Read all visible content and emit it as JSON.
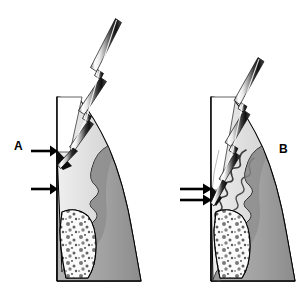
{
  "figure": {
    "type": "medical-illustration",
    "background_color": "#ffffff",
    "width": 308,
    "height": 291,
    "panels": [
      {
        "id": "A",
        "label": "A",
        "label_x": 14,
        "label_y": 140,
        "description": "Healthy gingival sulcus, probe tip stops at shallow depth",
        "arrow_count": 2,
        "arrows": [
          {
            "label": "",
            "y": 151,
            "tip_x": 57,
            "tail_x": 31,
            "meaning": "gingival-margin-level"
          },
          {
            "label": "",
            "y": 189,
            "tip_x": 57,
            "tail_x": 31,
            "meaning": "base-of-sulcus-level"
          }
        ],
        "probe_color_light": "#ffffff",
        "probe_color_dark": "#1a1a1a",
        "gingiva_color": "#a6a6a6",
        "tooth_color": "#dcdcdc",
        "bone_color": "#f2f2f2",
        "outline_color": "#000000"
      },
      {
        "id": "B",
        "label": "B",
        "label_x": 279,
        "label_y": 143,
        "description": "Periodontal pocket with inflamed gingiva, probe tip penetrates deeper",
        "arrow_count": 2,
        "arrows": [
          {
            "label": "",
            "y": 189,
            "tip_x": 211,
            "tail_x": 180,
            "meaning": "gingival-margin-level"
          },
          {
            "label": "",
            "y": 200,
            "tip_x": 211,
            "tail_x": 180,
            "meaning": "base-of-pocket-level"
          }
        ],
        "probe_color_light": "#ffffff",
        "probe_color_dark": "#1a1a1a",
        "gingiva_color": "#a6a6a6",
        "tooth_color": "#dcdcdc",
        "bone_color": "#f2f2f2",
        "outline_color": "#000000"
      }
    ],
    "colors": {
      "background": "#ffffff",
      "outline": "#000000",
      "tooth_enamel": "#ffffff",
      "tooth_dentin": "#dcdcdc",
      "gingiva": "#a6a6a6",
      "gingiva_shadow": "#8f8f8f",
      "bone_marrow": "#fafafa",
      "trabeculae": "#4a4a4a",
      "probe_metal_highlight": "#ffffff",
      "probe_metal_shadow": "#1f1f1f",
      "arrow": "#000000"
    }
  }
}
